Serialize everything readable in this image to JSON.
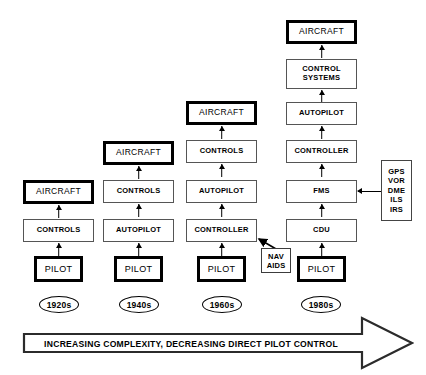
{
  "diagram": {
    "columns": [
      {
        "decade": "1920s",
        "nodes": [
          {
            "label": "AIRCRAFT",
            "style": "heavy"
          },
          {
            "label": "CONTROLS",
            "style": "thin"
          },
          {
            "label": "PILOT",
            "style": "heavy"
          }
        ]
      },
      {
        "decade": "1940s",
        "nodes": [
          {
            "label": "AIRCRAFT",
            "style": "heavy"
          },
          {
            "label": "CONTROLS",
            "style": "thin"
          },
          {
            "label": "AUTOPILOT",
            "style": "thin"
          },
          {
            "label": "PILOT",
            "style": "heavy"
          }
        ]
      },
      {
        "decade": "1960s",
        "nodes": [
          {
            "label": "AIRCRAFT",
            "style": "heavy"
          },
          {
            "label": "CONTROLS",
            "style": "thin"
          },
          {
            "label": "AUTOPILOT",
            "style": "thin"
          },
          {
            "label": "CONTROLLER",
            "style": "thin"
          },
          {
            "label": "PILOT",
            "style": "heavy"
          }
        ]
      },
      {
        "decade": "1980s",
        "nodes": [
          {
            "label": "AIRCRAFT",
            "style": "heavy"
          },
          {
            "label": "CONTROL\nSYSTEMS",
            "style": "thin"
          },
          {
            "label": "AUTOPILOT",
            "style": "thin"
          },
          {
            "label": "CONTROLLER",
            "style": "thin"
          },
          {
            "label": "FMS",
            "style": "thin"
          },
          {
            "label": "CDU",
            "style": "thin"
          },
          {
            "label": "PILOT",
            "style": "heavy"
          }
        ]
      }
    ],
    "nav_aids": {
      "label": "NAV\nAIDS"
    },
    "sensors": {
      "items": [
        "GPS",
        "VOR",
        "DME",
        "ILS",
        "IRS"
      ]
    },
    "bottom_arrow": {
      "label": "INCREASING COMPLEXITY, DECREASING DIRECT PILOT CONTROL"
    },
    "colors": {
      "line": "#000000",
      "thin_border": "#555555",
      "background": "#ffffff"
    }
  }
}
